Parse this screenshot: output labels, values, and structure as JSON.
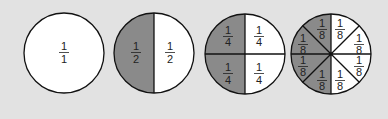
{
  "diagram": {
    "colors": {
      "background": "#e2e2e2",
      "shaded": "#8a8a8a",
      "unshaded": "#ffffff",
      "stroke": "#111111"
    },
    "circles": [
      {
        "name": "whole",
        "parts": 1,
        "labels": [
          {
            "num": "1",
            "den": "1"
          }
        ]
      },
      {
        "name": "halves",
        "parts": 2,
        "shaded": 1,
        "labels": [
          {
            "num": "1",
            "den": "2"
          },
          {
            "num": "1",
            "den": "2"
          }
        ]
      },
      {
        "name": "quarters",
        "parts": 4,
        "shaded": 2,
        "labels": [
          {
            "num": "1",
            "den": "4"
          },
          {
            "num": "1",
            "den": "4"
          },
          {
            "num": "1",
            "den": "4"
          },
          {
            "num": "1",
            "den": "4"
          }
        ]
      },
      {
        "name": "eighths",
        "parts": 8,
        "shaded": 4,
        "labels": [
          {
            "num": "1",
            "den": "8"
          },
          {
            "num": "1",
            "den": "8"
          },
          {
            "num": "1",
            "den": "8"
          },
          {
            "num": "1",
            "den": "8"
          },
          {
            "num": "1",
            "den": "8"
          },
          {
            "num": "1",
            "den": "8"
          },
          {
            "num": "1",
            "den": "8"
          },
          {
            "num": "1",
            "den": "8"
          }
        ]
      }
    ]
  }
}
